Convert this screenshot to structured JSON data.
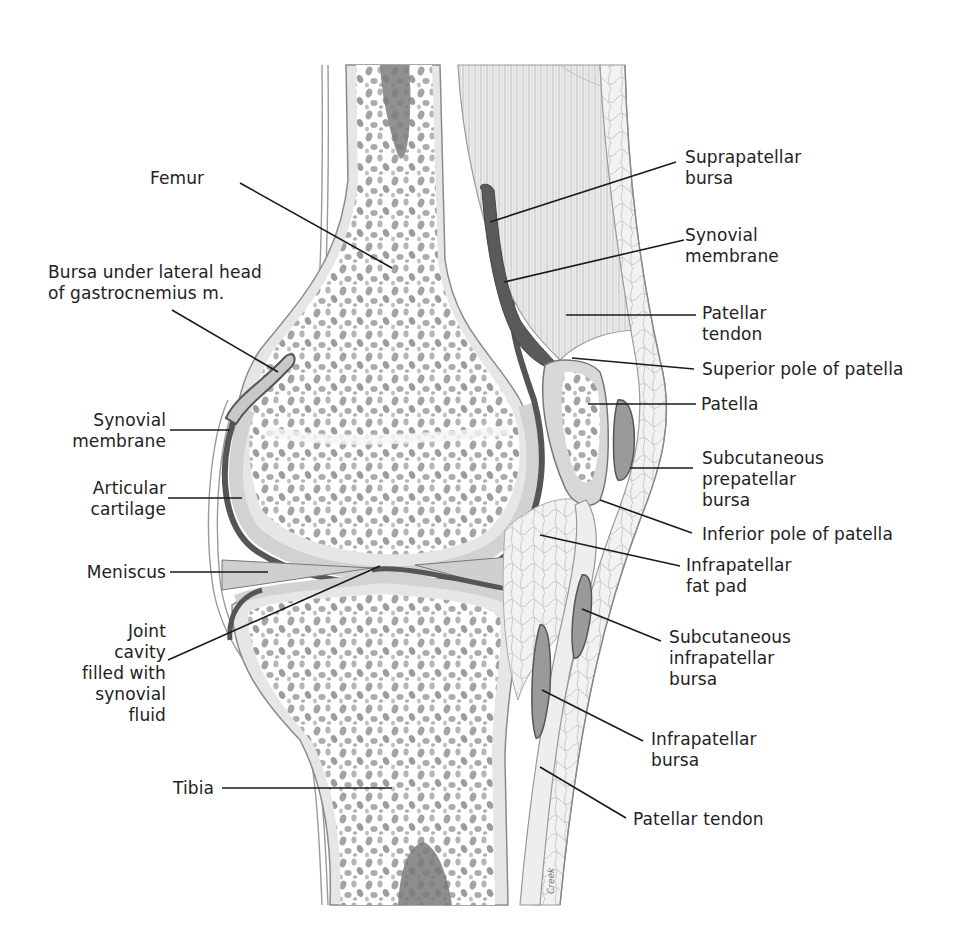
{
  "diagram": {
    "signature": "Creek",
    "colors": {
      "background": "#ffffff",
      "bone_marrow_spots": "#9a9a9a",
      "cartilage": "#d8d8d8",
      "synovial_dark": "#5a5a5a",
      "outline": "#8a8a8a",
      "leader_line": "#1a1a1a",
      "text": "#222222"
    },
    "labels_left": [
      {
        "id": "femur",
        "text": "Femur"
      },
      {
        "id": "bursa-gastrocnemius",
        "text": "Bursa under lateral head\nof gastrocnemius m."
      },
      {
        "id": "synovial-membrane-left",
        "text": "Synovial\nmembrane"
      },
      {
        "id": "articular-cartilage",
        "text": "Articular\ncartilage"
      },
      {
        "id": "meniscus",
        "text": "Meniscus"
      },
      {
        "id": "joint-cavity",
        "text": "Joint\ncavity\nfilled with\nsynovial\nfluid"
      },
      {
        "id": "tibia",
        "text": "Tibia"
      }
    ],
    "labels_right": [
      {
        "id": "suprapatellar-bursa",
        "text": "Suprapatellar\nbursa"
      },
      {
        "id": "synovial-membrane-right",
        "text": "Synovial\nmembrane"
      },
      {
        "id": "patellar-tendon-upper",
        "text": "Patellar\ntendon"
      },
      {
        "id": "superior-pole",
        "text": "Superior pole of patella"
      },
      {
        "id": "patella",
        "text": "Patella"
      },
      {
        "id": "subcutaneous-prepatellar-bursa",
        "text": "Subcutaneous\nprepatellar\nbursa"
      },
      {
        "id": "inferior-pole",
        "text": "Inferior pole of patella"
      },
      {
        "id": "infrapatellar-fat-pad",
        "text": "Infrapatellar\nfat pad"
      },
      {
        "id": "subcutaneous-infrapatellar-bursa",
        "text": "Subcutaneous\ninfrapatellar\nbursa"
      },
      {
        "id": "infrapatellar-bursa",
        "text": "Infrapatellar\nbursa"
      },
      {
        "id": "patellar-tendon-lower",
        "text": "Patellar tendon"
      }
    ]
  }
}
